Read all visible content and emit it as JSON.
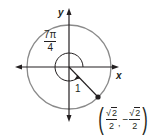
{
  "diagram": {
    "type": "unit-circle",
    "angle": {
      "numerator": "7π",
      "denominator": "4"
    },
    "axes": {
      "x_label": "x",
      "y_label": "y"
    },
    "radius_label": "1",
    "point": {
      "x": {
        "sign": "",
        "root": "√",
        "radicand": "2",
        "denominator": "2"
      },
      "y": {
        "sign": "−",
        "root": "√",
        "radicand": "2",
        "denominator": "2"
      },
      "separator": ","
    },
    "colors": {
      "circle": "#8a8a8a",
      "axes": "#231f20",
      "point": "#231f20"
    }
  }
}
